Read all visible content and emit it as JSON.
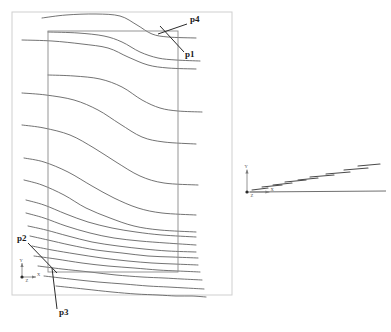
{
  "figure": {
    "title": "",
    "background": "#ffffff",
    "frame_color": "#cfcfcf",
    "curve_color": "#5a5a5a",
    "box_color": "#8a8a8a",
    "leader_color": "#2b2b2b",
    "label_color": "#1a1a1a"
  },
  "outer_frame": {
    "name": "outer-frame",
    "x": 12,
    "y": 12,
    "width": 220,
    "height": 283
  },
  "inner_box": {
    "name": "domain-boundary-box",
    "x": 48,
    "y": 31,
    "width": 130,
    "height": 241
  },
  "annotations": [
    {
      "id": "p4",
      "label": "p4",
      "text_x": 190,
      "text_y": 22,
      "leader": [
        [
          187,
          24
        ],
        [
          158,
          34
        ]
      ]
    },
    {
      "id": "p1",
      "label": "p1",
      "text_x": 185,
      "text_y": 57,
      "leader": [
        [
          184,
          52
        ],
        [
          160,
          26
        ]
      ]
    },
    {
      "id": "p2",
      "label": "p2",
      "text_x": 17,
      "text_y": 241,
      "leader": [
        [
          28,
          243
        ],
        [
          57,
          273
        ]
      ]
    },
    {
      "id": "p3",
      "label": "p3",
      "text_x": 59,
      "text_y": 315,
      "leader": [
        [
          57,
          309
        ],
        [
          52,
          268
        ]
      ]
    }
  ],
  "axis_triad_main": {
    "name": "coordinate-triad-main",
    "origin_x": 22,
    "origin_y": 277,
    "y_label": "Y",
    "x_label": "X",
    "z_label": "Z"
  },
  "axis_triad_right": {
    "name": "coordinate-triad-right",
    "origin_x": 247,
    "origin_y": 192,
    "y_label": "Y",
    "x_label": "X",
    "z_label": "Z"
  },
  "chart_data": {
    "type": "line",
    "title": "",
    "xlabel": "X",
    "ylabel": "Y",
    "grid": false,
    "legend": "none",
    "xlim": [
      0,
      391
    ],
    "ylim": [
      332,
      0
    ],
    "series": [
      {
        "name": "curve-01",
        "points": [
          [
            42,
            18
          ],
          [
            66,
            15
          ],
          [
            96,
            14
          ],
          [
            120,
            16
          ],
          [
            137,
            25
          ],
          [
            152,
            34
          ],
          [
            168,
            37
          ],
          [
            196,
            38
          ]
        ]
      },
      {
        "name": "curve-02",
        "points": [
          [
            48,
            32
          ],
          [
            78,
            33
          ],
          [
            104,
            36
          ],
          [
            122,
            42
          ],
          [
            140,
            52
          ],
          [
            158,
            58
          ],
          [
            176,
            60
          ],
          [
            200,
            61
          ]
        ]
      },
      {
        "name": "curve-03",
        "points": [
          [
            22,
            40
          ],
          [
            52,
            41
          ],
          [
            82,
            44
          ],
          [
            108,
            48
          ],
          [
            128,
            57
          ],
          [
            148,
            65
          ],
          [
            168,
            68
          ],
          [
            196,
            69
          ]
        ]
      },
      {
        "name": "curve-04",
        "points": [
          [
            48,
            75
          ],
          [
            74,
            76
          ],
          [
            100,
            79
          ],
          [
            122,
            87
          ],
          [
            142,
            100
          ],
          [
            160,
            108
          ],
          [
            178,
            111
          ],
          [
            202,
            112
          ]
        ]
      },
      {
        "name": "curve-05",
        "points": [
          [
            22,
            93
          ],
          [
            46,
            95
          ],
          [
            74,
            100
          ],
          [
            98,
            110
          ],
          [
            120,
            124
          ],
          [
            142,
            137
          ],
          [
            164,
            142
          ],
          [
            196,
            144
          ]
        ]
      },
      {
        "name": "curve-06",
        "points": [
          [
            22,
            125
          ],
          [
            44,
            128
          ],
          [
            70,
            135
          ],
          [
            94,
            148
          ],
          [
            116,
            162
          ],
          [
            140,
            176
          ],
          [
            164,
            183
          ],
          [
            198,
            185
          ]
        ]
      },
      {
        "name": "curve-07",
        "points": [
          [
            24,
            158
          ],
          [
            44,
            162
          ],
          [
            68,
            172
          ],
          [
            92,
            186
          ],
          [
            114,
            198
          ],
          [
            138,
            208
          ],
          [
            162,
            213
          ],
          [
            196,
            215
          ]
        ]
      },
      {
        "name": "curve-08",
        "points": [
          [
            24,
            180
          ],
          [
            42,
            185
          ],
          [
            64,
            195
          ],
          [
            86,
            208
          ],
          [
            110,
            218
          ],
          [
            134,
            226
          ],
          [
            160,
            230
          ],
          [
            196,
            232
          ]
        ]
      },
      {
        "name": "curve-09",
        "points": [
          [
            26,
            200
          ],
          [
            44,
            205
          ],
          [
            66,
            214
          ],
          [
            88,
            222
          ],
          [
            112,
            228
          ],
          [
            136,
            232
          ],
          [
            162,
            235
          ],
          [
            196,
            237
          ]
        ]
      },
      {
        "name": "curve-10",
        "points": [
          [
            26,
            213
          ],
          [
            44,
            218
          ],
          [
            66,
            226
          ],
          [
            90,
            233
          ],
          [
            114,
            238
          ],
          [
            140,
            241
          ],
          [
            166,
            243
          ],
          [
            196,
            245
          ]
        ]
      },
      {
        "name": "curve-11",
        "points": [
          [
            28,
            226
          ],
          [
            46,
            230
          ],
          [
            68,
            236
          ],
          [
            92,
            242
          ],
          [
            118,
            246
          ],
          [
            144,
            249
          ],
          [
            168,
            251
          ],
          [
            196,
            252
          ]
        ]
      },
      {
        "name": "curve-12",
        "points": [
          [
            30,
            236
          ],
          [
            48,
            240
          ],
          [
            70,
            245
          ],
          [
            96,
            250
          ],
          [
            122,
            253
          ],
          [
            148,
            256
          ],
          [
            172,
            257
          ],
          [
            198,
            258
          ]
        ]
      },
      {
        "name": "curve-13",
        "points": [
          [
            32,
            246
          ],
          [
            52,
            250
          ],
          [
            76,
            254
          ],
          [
            102,
            258
          ],
          [
            128,
            261
          ],
          [
            152,
            263
          ],
          [
            174,
            264
          ],
          [
            198,
            265
          ]
        ]
      },
      {
        "name": "curve-14",
        "points": [
          [
            34,
            256
          ],
          [
            56,
            259
          ],
          [
            82,
            263
          ],
          [
            108,
            266
          ],
          [
            134,
            268
          ],
          [
            158,
            270
          ],
          [
            178,
            271
          ],
          [
            200,
            272
          ]
        ]
      },
      {
        "name": "curve-15",
        "points": [
          [
            38,
            266
          ],
          [
            62,
            269
          ],
          [
            90,
            272
          ],
          [
            116,
            275
          ],
          [
            142,
            277
          ],
          [
            164,
            278
          ],
          [
            182,
            279
          ],
          [
            202,
            280
          ]
        ]
      },
      {
        "name": "curve-16",
        "points": [
          [
            44,
            276
          ],
          [
            70,
            279
          ],
          [
            98,
            282
          ],
          [
            124,
            284
          ],
          [
            148,
            286
          ],
          [
            168,
            287
          ],
          [
            186,
            288
          ],
          [
            204,
            289
          ]
        ]
      },
      {
        "name": "curve-17",
        "points": [
          [
            56,
            286
          ],
          [
            84,
            289
          ],
          [
            112,
            292
          ],
          [
            136,
            294
          ],
          [
            158,
            295
          ],
          [
            176,
            296
          ],
          [
            192,
            296
          ],
          [
            206,
            297
          ]
        ]
      }
    ]
  },
  "step_chart": {
    "type": "line",
    "title": "",
    "xlabel": "X",
    "ylabel": "Y",
    "grid": false,
    "legend": "none",
    "description": "Staircase profile plot of discrete level segments rising left to right above a baseline.",
    "baseline": {
      "x1": 250,
      "y1": 192,
      "x2": 386,
      "y2": 191
    },
    "steps": [
      {
        "name": "step-01",
        "x1": 252,
        "y1": 190,
        "x2": 268,
        "y2": 188
      },
      {
        "name": "step-02",
        "x1": 262,
        "y1": 187,
        "x2": 282,
        "y2": 185
      },
      {
        "name": "step-03",
        "x1": 273,
        "y1": 185,
        "x2": 292,
        "y2": 183
      },
      {
        "name": "step-04",
        "x1": 285,
        "y1": 182,
        "x2": 306,
        "y2": 180
      },
      {
        "name": "step-05",
        "x1": 298,
        "y1": 180,
        "x2": 318,
        "y2": 178
      },
      {
        "name": "step-06",
        "x1": 310,
        "y1": 177,
        "x2": 334,
        "y2": 175
      },
      {
        "name": "step-07",
        "x1": 326,
        "y1": 174,
        "x2": 350,
        "y2": 172
      },
      {
        "name": "step-08",
        "x1": 344,
        "y1": 170,
        "x2": 368,
        "y2": 168
      },
      {
        "name": "step-09",
        "x1": 358,
        "y1": 166,
        "x2": 380,
        "y2": 164
      }
    ]
  }
}
